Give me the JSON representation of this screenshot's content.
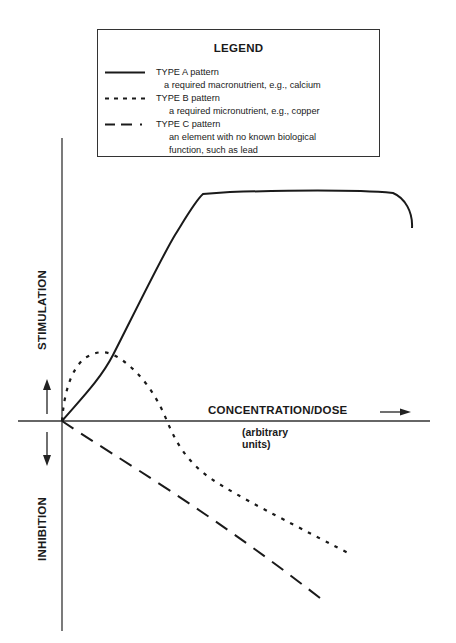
{
  "legend": {
    "title": "LEGEND",
    "entries": [
      {
        "name": "TYPE A pattern",
        "desc": "a required macronutrient, e.g., calcium",
        "style": "solid"
      },
      {
        "name": "TYPE B pattern",
        "desc": "a required micronutrient, e.g., copper",
        "style": "dotted"
      },
      {
        "name": "TYPE C pattern",
        "desc_line1": "an element with no known biological",
        "desc_line2": "function, such as lead",
        "style": "dash-dot"
      }
    ]
  },
  "axes": {
    "x_label": "CONCENTRATION/DOSE",
    "x_units_line1": "(arbitrary",
    "x_units_line2": "units)",
    "y_positive_label": "STIMULATION",
    "y_negative_label": "INHIBITION"
  },
  "colors": {
    "line": "#1a1a1a",
    "background": "#ffffff"
  },
  "chart_data": {
    "type": "line",
    "title": "LEGEND",
    "xlabel": "CONCENTRATION/DOSE (arbitrary units)",
    "ylabel_positive": "STIMULATION",
    "ylabel_negative": "INHIBITION",
    "x_units": "arbitrary",
    "grid": false,
    "legend_position": "top",
    "note": "Schematic dose-response curves; coordinates in arbitrary units with origin at (0,0), x to the right, y up (stimulation positive, inhibition negative).",
    "xlim": [
      -0.12,
      1.0
    ],
    "ylim": [
      -0.55,
      0.7
    ],
    "series": [
      {
        "name": "TYPE A pattern",
        "description": "a required macronutrient, e.g., calcium",
        "line_style": "solid",
        "points": [
          [
            0,
            0
          ],
          [
            0.05,
            0.066
          ],
          [
            0.098,
            0.132
          ],
          [
            0.142,
            0.205
          ],
          [
            0.199,
            0.322
          ],
          [
            0.262,
            0.446
          ],
          [
            0.302,
            0.514
          ],
          [
            0.34,
            0.564
          ],
          [
            0.5,
            0.572
          ],
          [
            0.7,
            0.575
          ],
          [
            0.85,
            0.568
          ],
          [
            0.9,
            0.55
          ],
          [
            0.93,
            0.5
          ]
        ]
      },
      {
        "name": "TYPE B pattern",
        "description": "a required micronutrient, e.g., copper",
        "line_style": "dotted",
        "points": [
          [
            0,
            0
          ],
          [
            0.01,
            0.06
          ],
          [
            0.03,
            0.12
          ],
          [
            0.06,
            0.16
          ],
          [
            0.1,
            0.166
          ],
          [
            0.14,
            0.15
          ],
          [
            0.19,
            0.1
          ],
          [
            0.23,
            0.04
          ],
          [
            0.26,
            0
          ],
          [
            0.29,
            -0.08
          ],
          [
            0.35,
            -0.145
          ],
          [
            0.46,
            -0.2
          ],
          [
            0.58,
            -0.25
          ],
          [
            0.7,
            -0.29
          ],
          [
            0.79,
            -0.32
          ]
        ]
      },
      {
        "name": "TYPE C pattern",
        "description": "an element with no known biological function, such as lead",
        "line_style": "dash-dot",
        "points": [
          [
            0,
            0
          ],
          [
            0.15,
            -0.1
          ],
          [
            0.3,
            -0.2
          ],
          [
            0.45,
            -0.29
          ],
          [
            0.6,
            -0.38
          ],
          [
            0.72,
            -0.45
          ]
        ]
      }
    ]
  },
  "plot": {
    "origin_px": [
      62,
      421
    ],
    "px_per_unit_x": 358,
    "px_per_unit_y": 398,
    "curve_a_path": "M62,421 C80,400 100,380 113,355 C125,332 160,260 175,235 C188,214 196,200 203,194 L230,192 C300,190 360,190 393,193 C405,198 413,212 412,228",
    "curve_b_path": "M62,421 C64,395 70,370 85,358 C98,350 108,350 122,360 C140,373 155,392 167,421 C175,440 185,460 210,478 C240,498 285,520 348,553",
    "curve_c_path": "M62,421 C120,460 200,505 320,598"
  }
}
